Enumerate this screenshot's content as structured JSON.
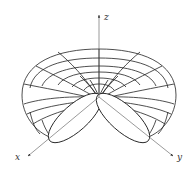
{
  "figure": {
    "axes": {
      "x_label": "x",
      "y_label": "y",
      "z_label": "z"
    },
    "colors": {
      "background": "#ffffff",
      "mesh_stroke": "#222222",
      "axis_stroke": "#555555"
    }
  }
}
